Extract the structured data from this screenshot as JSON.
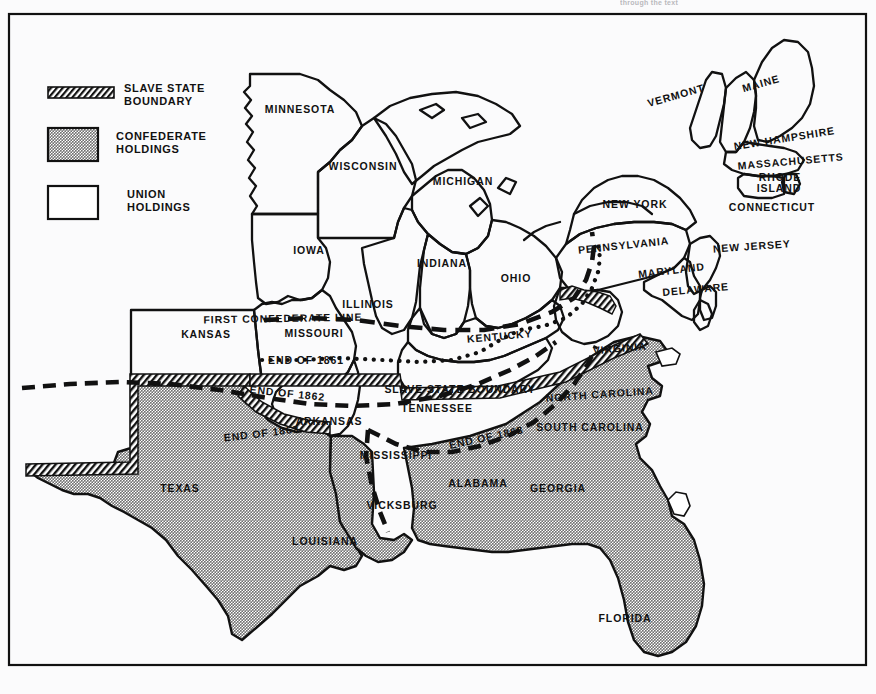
{
  "page": {
    "cut_off_header": "through the text",
    "background_color": "#fbfbfc",
    "ink_color": "#111111",
    "confederate_fill_color": "#a8a8a8",
    "union_fill_color": "#ffffff"
  },
  "legend": {
    "items": [
      {
        "key": "slave-state-boundary",
        "swatch": "hatched-bar",
        "line1": "SLAVE STATE",
        "line2": "BOUNDARY"
      },
      {
        "key": "confederate-holdings",
        "swatch": "gray-box",
        "line1": "CONFEDERATE",
        "line2": "HOLDINGS"
      },
      {
        "key": "union-holdings",
        "swatch": "white-box",
        "line1": "UNION",
        "line2": "HOLDINGS"
      }
    ]
  },
  "map": {
    "boundary_labels": [
      {
        "key": "first-confederate-line",
        "text": "FIRST CONFEDERATE LINE",
        "style": "dashed"
      },
      {
        "key": "end-of-1861",
        "text": "END OF 1861",
        "style": "dotted"
      },
      {
        "key": "end-of-1862",
        "text": "END OF 1862",
        "style": "dashed"
      },
      {
        "key": "end-of-1863-west",
        "text": "END OF 1863",
        "style": "hatched"
      },
      {
        "key": "end-of-1863-east",
        "text": "END OF 1863",
        "style": "dashed"
      },
      {
        "key": "slave-state-boundary-map",
        "text": "SLAVE STATE BOUNDARY",
        "style": "hatched"
      }
    ],
    "union_states": [
      {
        "name": "MINNESOTA",
        "x": 300,
        "y": 113
      },
      {
        "name": "WISCONSIN",
        "x": 363,
        "y": 170
      },
      {
        "name": "MICHIGAN",
        "x": 463,
        "y": 185
      },
      {
        "name": "IOWA",
        "x": 309,
        "y": 254
      },
      {
        "name": "ILLINOIS",
        "x": 368,
        "y": 308
      },
      {
        "name": "INDIANA",
        "x": 442,
        "y": 267
      },
      {
        "name": "OHIO",
        "x": 516,
        "y": 282
      },
      {
        "name": "NEW YORK",
        "x": 635,
        "y": 208
      },
      {
        "name": "PENNSYLVANIA",
        "x": 624,
        "y": 249
      },
      {
        "name": "VERMONT",
        "x": 677,
        "y": 99
      },
      {
        "name": "MAINE",
        "x": 762,
        "y": 87
      },
      {
        "name": "NEW HAMPSHIRE",
        "x": 785,
        "y": 142
      },
      {
        "name": "MASSACHUSETTS",
        "x": 791,
        "y": 165
      },
      {
        "name": "RHODE",
        "x": 780,
        "y": 179
      },
      {
        "name": "ISLAND",
        "x": 779,
        "y": 190
      },
      {
        "name": "CONNECTICUT",
        "x": 772,
        "y": 210
      },
      {
        "name": "NEW JERSEY",
        "x": 752,
        "y": 249
      },
      {
        "name": "KANSAS",
        "x": 206,
        "y": 338
      },
      {
        "name": "MISSOURI",
        "x": 314,
        "y": 337
      },
      {
        "name": "KENTUCKY",
        "x": 500,
        "y": 340
      },
      {
        "name": "TENNESSEE",
        "x": 437,
        "y": 412
      },
      {
        "name": "ARKANSAS",
        "x": 329,
        "y": 425
      },
      {
        "name": "MARYLAND",
        "x": 672,
        "y": 273
      },
      {
        "name": "DELAWARE",
        "x": 696,
        "y": 292
      }
    ],
    "confederate_states": [
      {
        "name": "TEXAS",
        "x": 180,
        "y": 492
      },
      {
        "name": "LOUISIANA",
        "x": 325,
        "y": 545
      },
      {
        "name": "MISSISSIPPI",
        "x": 396,
        "y": 459
      },
      {
        "name": "VICKSBURG",
        "x": 402,
        "y": 509
      },
      {
        "name": "ALABAMA",
        "x": 478,
        "y": 487
      },
      {
        "name": "GEORGIA",
        "x": 558,
        "y": 492
      },
      {
        "name": "FLORIDA",
        "x": 625,
        "y": 622
      },
      {
        "name": "SOUTH CAROLINA",
        "x": 590,
        "y": 430
      },
      {
        "name": "NORTH CAROLINA",
        "x": 600,
        "y": 398
      },
      {
        "name": "VIRGINIA",
        "x": 620,
        "y": 351
      }
    ]
  }
}
